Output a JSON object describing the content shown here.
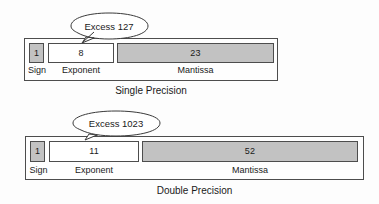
{
  "figure": {
    "colors": {
      "field_fill_gray": "#c2c2c2",
      "field_fill_white": "#ffffff",
      "outline": "#4d4d4d",
      "background": "#fdfdfd",
      "text": "#1a1a1a"
    }
  },
  "formats": [
    {
      "id": "single",
      "caption": "Single Precision",
      "callout": {
        "label": "Excess 127",
        "points_to": "exponent"
      },
      "fields": [
        {
          "name": "Sign",
          "bits": "1"
        },
        {
          "name": "Exponent",
          "bits": "8"
        },
        {
          "name": "Mantissa",
          "bits": "23"
        }
      ]
    },
    {
      "id": "double",
      "caption": "Double Precision",
      "callout": {
        "label": "Excess 1023",
        "points_to": "exponent"
      },
      "fields": [
        {
          "name": "Sign",
          "bits": "1"
        },
        {
          "name": "Exponent",
          "bits": "11"
        },
        {
          "name": "Mantissa",
          "bits": "52"
        }
      ]
    }
  ]
}
